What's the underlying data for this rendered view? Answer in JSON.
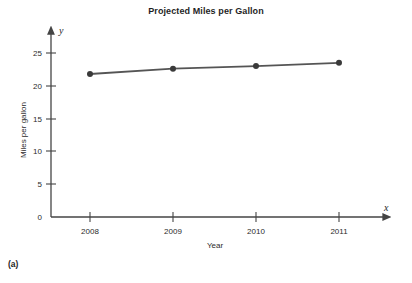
{
  "figure": {
    "title": "Projected Miles per Gallon",
    "panel_label": "(a)",
    "x_axis_variable": "x",
    "y_axis_variable": "y",
    "line_color": "#555555",
    "marker_color": "#3a3a3a",
    "axis_color": "#444444",
    "background": "#ffffff"
  },
  "chart_data": {
    "type": "line",
    "title": "Projected Miles per Gallon",
    "xlabel": "Year",
    "ylabel": "Miles per gallon",
    "categories": [
      "2008",
      "2009",
      "2010",
      "2011"
    ],
    "x": [
      2008,
      2009,
      2010,
      2011
    ],
    "values": [
      21.8,
      22.6,
      23.0,
      23.5
    ],
    "series": [
      {
        "name": "Projected miles per gallon",
        "values": [
          21.8,
          22.6,
          23.0,
          23.5
        ]
      }
    ],
    "xlim": [
      2007.6,
      2011.55
    ],
    "ylim": [
      0,
      26.5
    ],
    "yticks": [
      0,
      5,
      10,
      15,
      20,
      25
    ],
    "ytick_labels": [
      "0",
      "5",
      "10",
      "15",
      "20",
      "25"
    ],
    "xtick_labels": [
      "2008",
      "2009",
      "2010",
      "2011"
    ],
    "grid": false,
    "legend": false,
    "legend_position": "none",
    "marker": "circle",
    "annotations": {
      "x_axis_arrow_label": "x",
      "y_axis_arrow_label": "y",
      "panel": "(a)"
    }
  }
}
